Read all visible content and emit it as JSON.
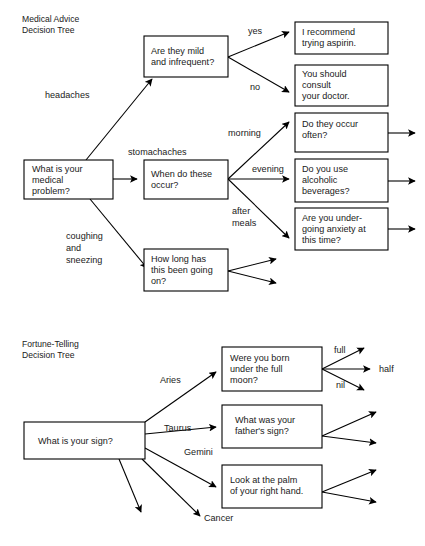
{
  "page": {
    "width": 425,
    "height": 546,
    "background": "#ffffff",
    "ink": "#000000"
  },
  "diagrams": [
    {
      "id": "medical-advice-decision-tree",
      "title": {
        "lines": [
          "Medical Advice",
          "Decision Tree"
        ],
        "x": 22,
        "y": 22
      },
      "nodes": [
        {
          "id": "medical-root",
          "name": "node-medical-problem",
          "lines": [
            "What is your",
            "medical",
            "problem?"
          ],
          "x": 24,
          "y": 160,
          "w": 89,
          "h": 39
        },
        {
          "id": "mild-infrequent",
          "name": "node-mild-and-infrequent",
          "lines": [
            "Are they mild",
            "and infrequent?"
          ],
          "x": 144,
          "y": 36,
          "w": 84,
          "h": 41
        },
        {
          "id": "recommend-aspirin",
          "name": "node-recommend-aspirin",
          "lines": [
            "I recommend",
            "trying aspirin."
          ],
          "x": 295,
          "y": 22,
          "w": 93,
          "h": 32
        },
        {
          "id": "consult-doctor",
          "name": "node-consult-doctor",
          "lines": [
            "You should",
            "consult",
            "your doctor."
          ],
          "x": 295,
          "y": 65,
          "w": 93,
          "h": 41
        },
        {
          "id": "when-occur",
          "name": "node-when-do-these-occur",
          "lines": [
            "When do these",
            "occur?"
          ],
          "x": 144,
          "y": 160,
          "w": 84,
          "h": 39
        },
        {
          "id": "occur-often",
          "name": "node-do-they-occur-often",
          "lines": [
            "Do they occur",
            "often?"
          ],
          "x": 295,
          "y": 113,
          "w": 93,
          "h": 39
        },
        {
          "id": "alcoholic-beverages",
          "name": "node-alcoholic-beverages",
          "lines": [
            "Do you use",
            "alcoholic",
            "beverages?"
          ],
          "x": 295,
          "y": 159,
          "w": 93,
          "h": 43
        },
        {
          "id": "anxiety",
          "name": "node-undergoing-anxiety",
          "lines": [
            "Are you under-",
            "going anxiety at",
            "this time?"
          ],
          "x": 295,
          "y": 208,
          "w": 93,
          "h": 42
        },
        {
          "id": "how-long",
          "name": "node-how-long-going-on",
          "lines": [
            "How long has",
            "this been going",
            "on?"
          ],
          "x": 144,
          "y": 249,
          "w": 84,
          "h": 42
        }
      ],
      "edge_labels": [
        {
          "name": "edge-label-headaches",
          "lines": [
            "headaches"
          ],
          "x": 45,
          "y": 98
        },
        {
          "name": "edge-label-stomachaches",
          "lines": [
            "stomachaches"
          ],
          "x": 128,
          "y": 155
        },
        {
          "name": "edge-label-coughing-and-sneezing",
          "lines": [
            "coughing",
            "and",
            "sneezing"
          ],
          "x": 66,
          "y": 239
        },
        {
          "name": "edge-label-yes",
          "lines": [
            "yes"
          ],
          "x": 248,
          "y": 34
        },
        {
          "name": "edge-label-no",
          "lines": [
            "no"
          ],
          "x": 250,
          "y": 90
        },
        {
          "name": "edge-label-morning",
          "lines": [
            "morning"
          ],
          "x": 228,
          "y": 136
        },
        {
          "name": "edge-label-evening",
          "lines": [
            "evening"
          ],
          "x": 252,
          "y": 172
        },
        {
          "name": "edge-label-after-meals",
          "lines": [
            "after",
            "meals"
          ],
          "x": 232,
          "y": 214
        }
      ]
    },
    {
      "id": "fortune-telling-decision-tree",
      "title": {
        "lines": [
          "Fortune-Telling",
          "Decision Tree"
        ],
        "x": 22,
        "y": 347
      },
      "nodes": [
        {
          "id": "fortune-root",
          "name": "node-what-is-your-sign",
          "lines": [
            "What is your sign?"
          ],
          "x": 24,
          "y": 422,
          "w": 121,
          "h": 37
        },
        {
          "id": "full-moon",
          "name": "node-born-under-full-moon",
          "lines": [
            "Were you born",
            "under the full",
            "moon?"
          ],
          "x": 222,
          "y": 347,
          "w": 100,
          "h": 44
        },
        {
          "id": "fathers-sign",
          "name": "node-fathers-sign",
          "lines": [
            "What was your",
            "father's sign?"
          ],
          "x": 222,
          "y": 405,
          "w": 100,
          "h": 43
        },
        {
          "id": "palm",
          "name": "node-look-at-palm",
          "lines": [
            "Look at the palm",
            "of your right hand."
          ],
          "x": 222,
          "y": 465,
          "w": 100,
          "h": 43
        }
      ],
      "edge_labels": [
        {
          "name": "edge-label-aries",
          "lines": [
            "Aries"
          ],
          "x": 160,
          "y": 383
        },
        {
          "name": "edge-label-taurus",
          "lines": [
            "Taurus"
          ],
          "x": 164,
          "y": 431
        },
        {
          "name": "edge-label-gemini",
          "lines": [
            "Gemini"
          ],
          "x": 184,
          "y": 455
        },
        {
          "name": "edge-label-cancer",
          "lines": [
            "Cancer"
          ],
          "x": 204,
          "y": 521
        },
        {
          "name": "edge-label-full",
          "lines": [
            "full"
          ],
          "x": 334,
          "y": 353
        },
        {
          "name": "edge-label-half",
          "lines": [
            "half"
          ],
          "x": 379,
          "y": 372
        },
        {
          "name": "edge-label-nil",
          "lines": [
            "nil"
          ],
          "x": 336,
          "y": 388
        }
      ]
    }
  ]
}
